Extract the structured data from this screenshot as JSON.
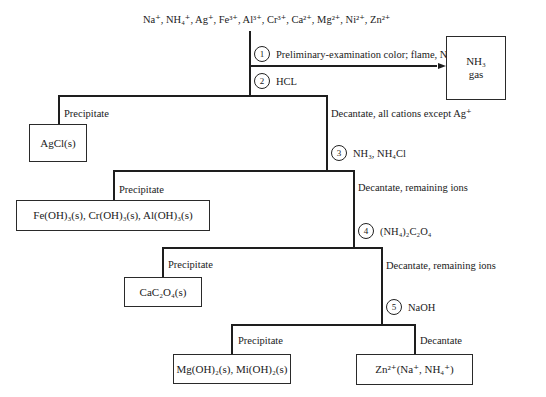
{
  "diagram": {
    "type": "flowchart",
    "start_ions": "Na⁺, NH₄⁺, Ag⁺, Fe³⁺, Al³⁺, Cr³⁺, Ca²⁺, Mg²⁺, Ni²⁺, Zn²⁺",
    "steps": [
      {
        "number": "1",
        "reagent": "Preliminary-examination color; flame, NH₄⁺"
      },
      {
        "number": "2",
        "reagent": "HCL"
      },
      {
        "number": "3",
        "reagent": "NH₃, NH₄Cl"
      },
      {
        "number": "4",
        "reagent": "(NH₄)₂C₂O₄"
      },
      {
        "number": "5",
        "reagent": "NaOH"
      }
    ],
    "side_product": {
      "line1": "NH₃",
      "line2": "gas"
    },
    "branch_labels": {
      "precipitate": "Precipitate",
      "decantate_1": "Decantate, all cations except Ag⁺",
      "decantate_2": "Decantate, remaining ions",
      "decantate_3": "Decantate, remaining ions",
      "decantate_4": "Decantate"
    },
    "products": {
      "agcl": "AgCl(s)",
      "hydroxides": "Fe(OH)₃(s), Cr(OH)₃(s), Al(OH)₃(s)",
      "oxalate": "CaC₂O₄(s)",
      "mg_ni": "Mg(OH)₂(s), Mi(OH)₂(s)",
      "final": "Zn²⁺(Na⁺, NH₄⁺)"
    }
  }
}
